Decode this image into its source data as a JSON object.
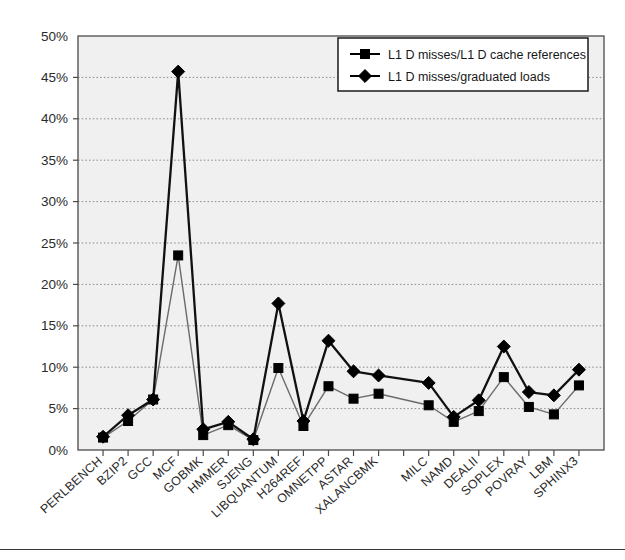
{
  "chart_data": {
    "type": "line",
    "title": "",
    "xlabel": "",
    "ylabel": "",
    "ylim": [
      0,
      50
    ],
    "ytick_values": [
      0,
      5,
      10,
      15,
      20,
      25,
      30,
      35,
      40,
      45,
      50
    ],
    "ytick_labels": [
      "0%",
      "5%",
      "10%",
      "15%",
      "20%",
      "25%",
      "30%",
      "35%",
      "40%",
      "45%",
      "50%"
    ],
    "grid": true,
    "grid_style": "dotted-horizontal",
    "legend_position": "top-right",
    "categories": [
      "PERLBENCH",
      "BZIP2",
      "GCC",
      "MCF",
      "GOBMK",
      "HMMER",
      "SJENG",
      "LIBQUANTUM",
      "H264REF",
      "OMNETPP",
      "ASTAR",
      "XALANCBMK",
      "MILC",
      "NAMD",
      "DEALII",
      "SOPLEX",
      "POVRAY",
      "LBM",
      "SPHINX3"
    ],
    "group_break_after": "XALANCBMK",
    "series": [
      {
        "name": "L1 D misses/L1 D cache references",
        "marker": "square",
        "color": "#000000",
        "values": [
          1.5,
          3.5,
          6.1,
          23.5,
          1.8,
          3.0,
          1.2,
          9.9,
          2.9,
          7.7,
          6.2,
          6.8,
          5.4,
          3.4,
          4.7,
          8.8,
          5.2,
          4.3,
          7.8
        ]
      },
      {
        "name": "L1 D misses/graduated loads",
        "marker": "diamond",
        "color": "#000000",
        "values": [
          1.6,
          4.2,
          6.1,
          45.7,
          2.5,
          3.4,
          1.3,
          17.7,
          3.5,
          13.2,
          9.5,
          9.0,
          8.1,
          4.0,
          6.0,
          12.5,
          7.0,
          6.6,
          9.7
        ]
      }
    ]
  },
  "legend": {
    "entries": [
      {
        "label": "L1 D misses/L1 D cache references",
        "marker": "square-marker"
      },
      {
        "label": "L1 D misses/graduated loads",
        "marker": "diamond-marker"
      }
    ]
  },
  "colors": {
    "plot_background": "#f0f0f0",
    "axis": "#4a4a4a",
    "grid": "#888888",
    "series_line": "#111111",
    "series_line_light": "#6b6b6b",
    "legend_border": "#1a1a1a",
    "page_background": "#ffffff"
  }
}
